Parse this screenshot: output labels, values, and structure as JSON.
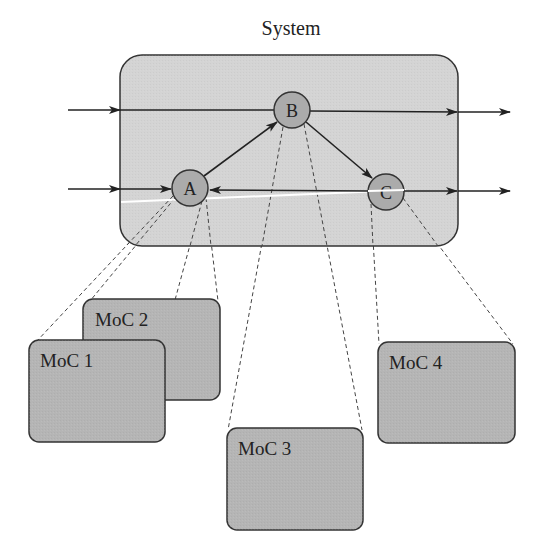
{
  "title": "System",
  "colors": {
    "system_fill": "#d4d4d4",
    "node_fill": "#ababab",
    "moc_fill": "#b5b5b5",
    "stroke": "#333333",
    "highlight_line": "#ffffff"
  },
  "system": {
    "label": "System",
    "x": 120,
    "y": 55,
    "width": 338,
    "height": 191,
    "radius": 22
  },
  "nodes": [
    {
      "id": "A",
      "label": "A",
      "cx": 190,
      "cy": 188,
      "r": 18
    },
    {
      "id": "B",
      "label": "B",
      "cx": 292,
      "cy": 110,
      "r": 18
    },
    {
      "id": "C",
      "label": "C",
      "cx": 386,
      "cy": 192,
      "r": 18
    }
  ],
  "edges": [
    {
      "from": "external-left-top",
      "to": "system",
      "kind": "input"
    },
    {
      "from": "external-left-bottom",
      "to": "A",
      "kind": "input"
    },
    {
      "from": "system-left-top",
      "to": "system-right-top",
      "through": "B",
      "kind": "pass-through"
    },
    {
      "from": "A",
      "to": "B",
      "kind": "internal"
    },
    {
      "from": "B",
      "to": "C",
      "kind": "internal"
    },
    {
      "from": "C",
      "to": "A",
      "kind": "internal"
    },
    {
      "from": "C",
      "to": "external-right-bottom",
      "kind": "output"
    },
    {
      "from": "system",
      "to": "external-right-top",
      "kind": "output"
    }
  ],
  "mocs": [
    {
      "id": "moc1",
      "label": "MoC 1",
      "x": 29,
      "y": 340,
      "width": 136,
      "height": 102,
      "node": "A"
    },
    {
      "id": "moc2",
      "label": "MoC 2",
      "x": 83,
      "y": 299,
      "width": 137,
      "height": 101,
      "node": "A"
    },
    {
      "id": "moc3",
      "label": "MoC 3",
      "x": 227,
      "y": 428,
      "width": 136,
      "height": 102,
      "node": "B"
    },
    {
      "id": "moc4",
      "label": "MoC 4",
      "x": 378,
      "y": 342,
      "width": 137,
      "height": 101,
      "node": "C"
    }
  ]
}
